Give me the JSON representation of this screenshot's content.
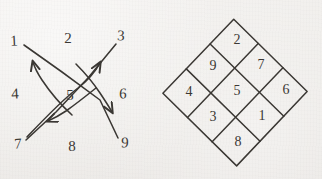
{
  "figure": {
    "background_color": "#f1efed",
    "ink_color": "#3b3834"
  },
  "left_diagram": {
    "name": "numbered-grid-with-arrows",
    "description": "Hand drawn 3 by 3 arrangement of the numbers 1 through 9 in reading order with two crossing straight arrows and two crossing curved arrows passing through the centre number 5",
    "cells": [
      {
        "label": "1",
        "row": 0,
        "col": 0,
        "x": 14,
        "y": 41
      },
      {
        "label": "2",
        "row": 0,
        "col": 1,
        "x": 68,
        "y": 38
      },
      {
        "label": "3",
        "row": 0,
        "col": 2,
        "x": 121,
        "y": 36
      },
      {
        "label": "4",
        "row": 1,
        "col": 0,
        "x": 15,
        "y": 94
      },
      {
        "label": "5",
        "row": 1,
        "col": 1,
        "x": 70,
        "y": 95
      },
      {
        "label": "6",
        "row": 1,
        "col": 2,
        "x": 123,
        "y": 94
      },
      {
        "label": "7",
        "row": 2,
        "col": 0,
        "x": 18,
        "y": 144
      },
      {
        "label": "8",
        "row": 2,
        "col": 1,
        "x": 72,
        "y": 146
      },
      {
        "label": "9",
        "row": 2,
        "col": 2,
        "x": 125,
        "y": 143
      }
    ],
    "arrows": [
      {
        "name": "arrow-1-to-9",
        "kind": "straight",
        "from": "1",
        "to": "9",
        "head": "down-right"
      },
      {
        "name": "arrow-3-to-7",
        "kind": "straight",
        "from": "3",
        "to": "7",
        "head": "down-left"
      },
      {
        "name": "arc-7-to-3",
        "kind": "curved",
        "from": "7",
        "to": "3",
        "head": "up-right"
      },
      {
        "name": "arc-1-to-9",
        "kind": "curved",
        "from": "1",
        "to": "9",
        "head": "up-left"
      }
    ]
  },
  "right_diagram": {
    "name": "lo-shu-magic-square-rotated",
    "description": "The 3 by 3 Lo Shu magic square drawn as a diamond, rotated forty five degrees",
    "rotation_degrees": 45,
    "magic_constant": 15,
    "rows": [
      [
        "4",
        "9",
        "2"
      ],
      [
        "3",
        "5",
        "7"
      ],
      [
        "8",
        "1",
        "6"
      ]
    ],
    "cells": [
      {
        "label": "4",
        "row": 0,
        "col": 0
      },
      {
        "label": "9",
        "row": 0,
        "col": 1
      },
      {
        "label": "2",
        "row": 0,
        "col": 2
      },
      {
        "label": "3",
        "row": 1,
        "col": 0
      },
      {
        "label": "5",
        "row": 1,
        "col": 1
      },
      {
        "label": "7",
        "row": 1,
        "col": 2
      },
      {
        "label": "8",
        "row": 2,
        "col": 0
      },
      {
        "label": "1",
        "row": 2,
        "col": 1
      },
      {
        "label": "6",
        "row": 2,
        "col": 2
      }
    ]
  }
}
